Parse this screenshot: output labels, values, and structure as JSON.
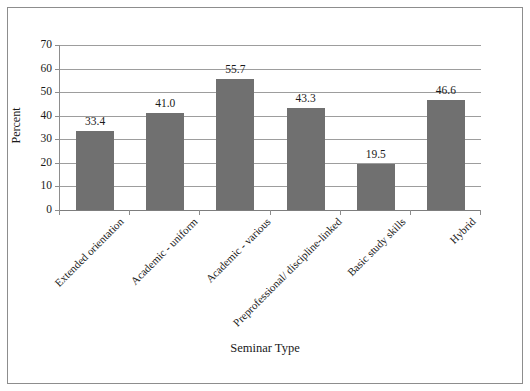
{
  "chart_data": {
    "type": "bar",
    "title": "",
    "xlabel": "Seminar Type",
    "ylabel": "Percent",
    "categories": [
      "Extended orientation",
      "Academic - uniform",
      "Academic - various",
      "Preprofessional/ discipline-linked",
      "Basic study skills",
      "Hybrid"
    ],
    "values": [
      33.4,
      41.0,
      55.7,
      43.3,
      19.5,
      46.6
    ],
    "value_labels": [
      "33.4",
      "41.0",
      "55.7",
      "43.3",
      "19.5",
      "46.6"
    ],
    "ylim": [
      0,
      70
    ],
    "ytick_values": [
      0,
      10,
      20,
      30,
      40,
      50,
      60,
      70
    ],
    "ytick_labels": [
      "0",
      "10",
      "20",
      "30",
      "40",
      "50",
      "60",
      "70"
    ],
    "grid": "horizontal",
    "legend": "none",
    "bar_color": "#707070",
    "axis_color": "#8d8d8d",
    "gridline_color": "#9d9d9d",
    "text_color": "#1a1a1a",
    "background_color": "#ffffff",
    "frame_border_color": "#8d8d8d"
  }
}
